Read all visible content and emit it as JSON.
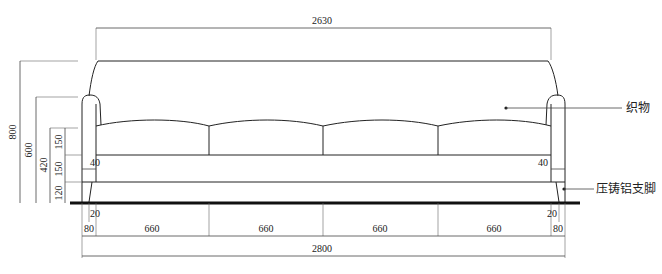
{
  "drawing": {
    "title": "Sofa front elevation",
    "dimensions": {
      "top_width": "2630",
      "overall_width": "2800",
      "cushion_widths": [
        "660",
        "660",
        "660",
        "660"
      ],
      "side_80_left": "80",
      "side_80_right": "80",
      "leg_offset_left": "20",
      "leg_offset_right": "20",
      "arm_inset_left": "40",
      "arm_inset_right": "40",
      "height_total": "800",
      "height_arm": "600",
      "height_seat_top": "420",
      "height_cushion": "150",
      "height_base": "150",
      "height_leg": "120"
    },
    "annotations": {
      "fabric": "织物",
      "legs": "压铸铝支脚"
    },
    "colors": {
      "line": "#222222",
      "dimension_line": "#444444",
      "floor": "#111111",
      "background": "#ffffff"
    }
  }
}
